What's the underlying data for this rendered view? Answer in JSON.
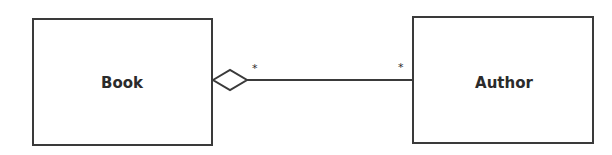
{
  "diagram": {
    "type": "UML class diagram",
    "classes": [
      {
        "id": "book",
        "name": "Book"
      },
      {
        "id": "author",
        "name": "Author"
      }
    ],
    "relationship": {
      "kind": "aggregation",
      "from": "Book",
      "to": "Author",
      "source_multiplicity": "*",
      "target_multiplicity": "*"
    },
    "colors": {
      "stroke": "#3a3a3a",
      "text": "#2b2b2b",
      "background": "#ffffff"
    }
  }
}
